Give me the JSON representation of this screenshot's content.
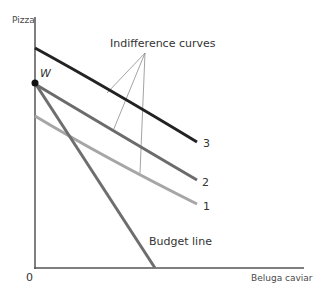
{
  "diagram": {
    "type": "indifference-curve-budget-line",
    "axes": {
      "y_label": "Pizza",
      "x_label": "Beluga caviar",
      "origin_label": "0"
    },
    "point": {
      "label": "W"
    },
    "annotation": "Indifference curves",
    "budget_line_label": "Budget line",
    "curves": [
      {
        "id": "1",
        "label": "1",
        "color": "#a6a6a6"
      },
      {
        "id": "2",
        "label": "2",
        "color": "#6b6b6b"
      },
      {
        "id": "3",
        "label": "3",
        "color": "#222222"
      }
    ],
    "colors": {
      "axis": "#555555",
      "budget_line": "#6e6e6e",
      "pointer": "#8c8c8c",
      "point": "#111111"
    }
  }
}
